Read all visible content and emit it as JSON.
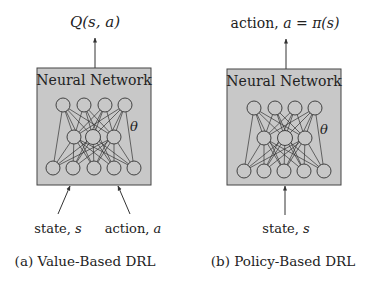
{
  "colors": {
    "box_fill": "#c8c8c8",
    "box_stroke": "#444444",
    "node_fill": "#c8c8c8",
    "line": "#333333",
    "text": "#222222"
  },
  "panels": [
    {
      "id": "a",
      "box_title": "Neural Network",
      "param_symbol": "θ",
      "output_label": "Q(s, a)",
      "inputs": [
        {
          "label_text": "state, ",
          "label_var": "s"
        },
        {
          "label_text": "action, ",
          "label_var": "a"
        }
      ],
      "caption": "(a) Value-Based DRL",
      "layers": [
        4,
        3,
        5
      ]
    },
    {
      "id": "b",
      "box_title": "Neural Network",
      "param_symbol": "θ",
      "output_label_text": "action, ",
      "output_label_math": "a = π(s)",
      "inputs": [
        {
          "label_text": "state, ",
          "label_var": "s"
        }
      ],
      "caption": "(b) Policy-Based DRL",
      "layers": [
        4,
        3,
        5
      ]
    }
  ]
}
